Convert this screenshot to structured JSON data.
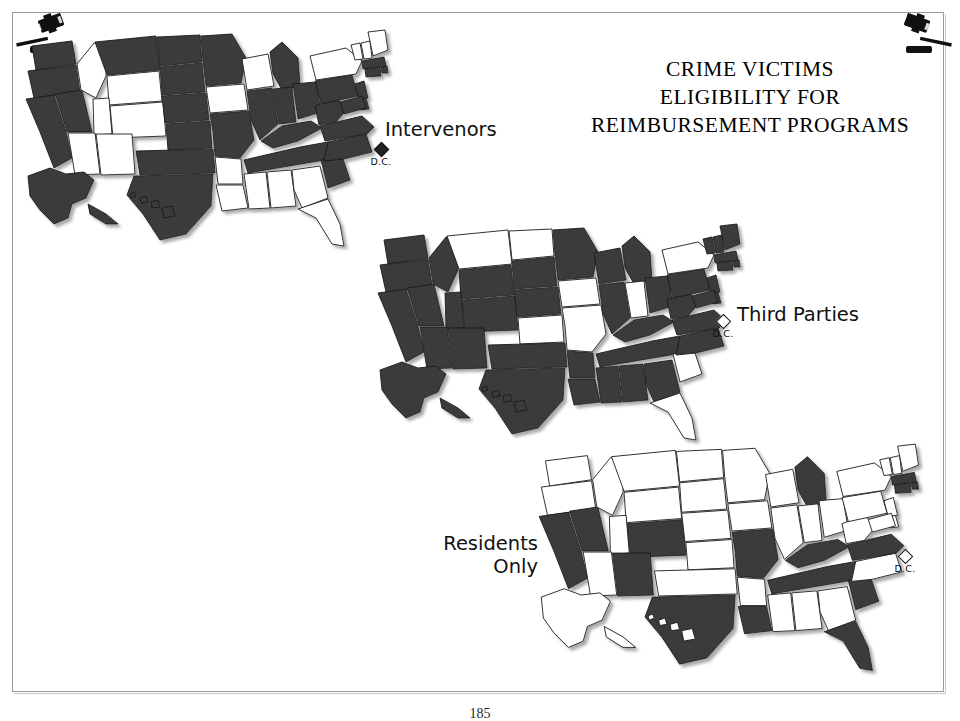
{
  "page": {
    "title_lines": [
      "CRIME VICTIMS",
      "ELIGIBILITY FOR",
      "REIMBURSEMENT PROGRAMS"
    ],
    "page_number": "185",
    "background_color": "#ffffff",
    "frame_color": "#9a9a9a"
  },
  "legend": {
    "shaded_color": "#3b3b3b",
    "unshaded_color": "#ffffff",
    "shaded_meaning": "eligible",
    "unshaded_meaning": "not eligible"
  },
  "decorations": {
    "gavel_top_left": "gavel-icon",
    "gavel_top_right": "gavel-icon"
  },
  "dc_markers": [
    {
      "map": "intervenors",
      "label": "D.C.",
      "filled": true
    },
    {
      "map": "third_parties",
      "label": "D.C.",
      "filled": false
    },
    {
      "map": "residents_only",
      "label": "D.C.",
      "filled": false
    }
  ],
  "maps": [
    {
      "id": "intervenors",
      "label": "Intervenors",
      "shaded_states": [
        "WA",
        "OR",
        "CA",
        "NV",
        "MT",
        "ND",
        "SD",
        "NE",
        "KS",
        "OK",
        "TX",
        "NM",
        "MN",
        "MO",
        "IL",
        "IN",
        "OH",
        "MI",
        "PA",
        "KY",
        "TN",
        "NC",
        "SC",
        "VA",
        "WV",
        "MD",
        "DE",
        "NJ",
        "MA",
        "CT",
        "RI",
        "AK",
        "HI"
      ],
      "unshaded_states": [
        "ID",
        "WY",
        "UT",
        "CO",
        "AZ",
        "IA",
        "WI",
        "AR",
        "LA",
        "MS",
        "AL",
        "GA",
        "FL",
        "NY",
        "ME",
        "NH",
        "VT"
      ]
    },
    {
      "id": "third_parties",
      "label": "Third Parties",
      "shaded_states": [
        "WA",
        "OR",
        "CA",
        "NV",
        "ID",
        "WY",
        "UT",
        "CO",
        "AZ",
        "NM",
        "TX",
        "OK",
        "AR",
        "LA",
        "MS",
        "AL",
        "GA",
        "TN",
        "KY",
        "WV",
        "VA",
        "NC",
        "OH",
        "MI",
        "WI",
        "MN",
        "SD",
        "NE",
        "IL",
        "PA",
        "NJ",
        "MD",
        "DE",
        "NY_NO",
        "ME",
        "NH",
        "VT",
        "MA",
        "CT",
        "RI",
        "AK",
        "HI"
      ],
      "unshaded_states": [
        "MT",
        "ND",
        "IA",
        "IN",
        "KS",
        "MO",
        "SC",
        "FL",
        "NY"
      ]
    },
    {
      "id": "residents_only",
      "label": "Residents\nOnly",
      "shaded_states": [
        "CA",
        "NV",
        "CO",
        "NM",
        "TX",
        "LA",
        "MO",
        "MI",
        "KY",
        "TN",
        "VA",
        "SC",
        "FL",
        "MA",
        "CT",
        "RI"
      ],
      "unshaded_states": [
        "WA",
        "OR",
        "ID",
        "MT",
        "WY",
        "UT",
        "AZ",
        "ND",
        "SD",
        "NE",
        "KS",
        "OK",
        "MN",
        "IA",
        "WI",
        "IL",
        "IN",
        "OH",
        "AR",
        "MS",
        "AL",
        "GA",
        "NC",
        "WV",
        "PA",
        "NY",
        "NJ",
        "MD",
        "DE",
        "ME",
        "NH",
        "VT",
        "AK",
        "HI"
      ]
    }
  ]
}
